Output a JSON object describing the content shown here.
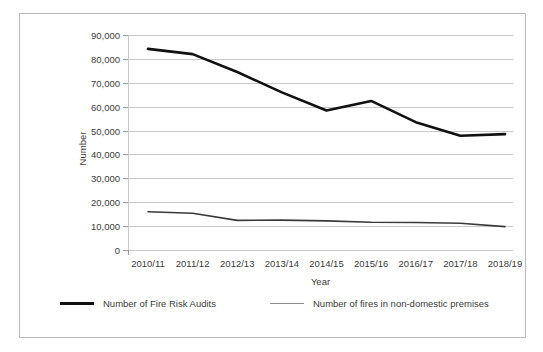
{
  "chart_data": {
    "type": "line",
    "title": "",
    "xlabel": "Year",
    "ylabel": "Number",
    "categories": [
      "2010/11",
      "2011/12",
      "2012/13",
      "2013/14",
      "2014/15",
      "2015/16",
      "2016/17",
      "2017/18",
      "2018/19"
    ],
    "series": [
      {
        "name": "Number of Fire Risk Audits",
        "values": [
          84200,
          82000,
          74500,
          66000,
          58400,
          62400,
          53500,
          47800,
          48500
        ],
        "color": "#111111",
        "width": 2.6
      },
      {
        "name": "Number of fires in non-domestic premises",
        "values": [
          16000,
          15400,
          12400,
          12500,
          12200,
          11600,
          11500,
          11200,
          9800
        ],
        "color": "#3a3a3a",
        "width": 1.6
      }
    ],
    "ylim": [
      0,
      90000
    ],
    "ytick_values": [
      0,
      10000,
      20000,
      30000,
      40000,
      50000,
      60000,
      70000,
      80000,
      90000
    ],
    "ytick_labels": [
      "0",
      "10,000",
      "20,000",
      "30,000",
      "40,000",
      "50,000",
      "60,000",
      "70,000",
      "80,000",
      "90,000"
    ],
    "grid": true,
    "legend_position": "bottom"
  },
  "legend": {
    "entries": [
      {
        "label": "Number of Fire Risk Audits"
      },
      {
        "label": "Number of fires in non-domestic premises"
      }
    ]
  },
  "colors": {
    "grid": "#c8c8c8",
    "frame": "#b9b9b9",
    "text": "#3b3b3b"
  }
}
